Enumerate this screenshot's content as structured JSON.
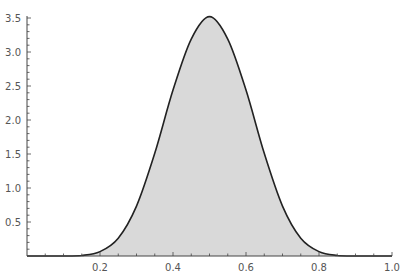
{
  "chart_data": {
    "type": "area",
    "title": "",
    "xlabel": "",
    "ylabel": "",
    "xlim": [
      0,
      1.0
    ],
    "ylim": [
      0,
      3.5
    ],
    "grid": false,
    "legend": null,
    "x_ticks": [
      "0.2",
      "0.4",
      "0.6",
      "0.8",
      "1.0"
    ],
    "y_ticks": [
      "0.5",
      "1.0",
      "1.5",
      "2.0",
      "2.5",
      "3.0",
      "3.5"
    ],
    "series": [
      {
        "name": "density",
        "x": [
          0.0,
          0.05,
          0.1,
          0.15,
          0.2,
          0.25,
          0.3,
          0.35,
          0.4,
          0.45,
          0.5,
          0.55,
          0.6,
          0.65,
          0.7,
          0.75,
          0.8,
          0.85,
          0.9,
          0.95,
          1.0
        ],
        "values": [
          0.0,
          0.0,
          0.0004,
          0.008,
          0.064,
          0.262,
          0.734,
          1.51,
          2.44,
          3.19,
          3.52,
          3.19,
          2.44,
          1.51,
          0.734,
          0.262,
          0.064,
          0.008,
          0.0004,
          0.0,
          0.0
        ]
      }
    ],
    "colors": {
      "fill": "#d9d9d9",
      "line": "#222222",
      "axis": "#444444"
    }
  }
}
